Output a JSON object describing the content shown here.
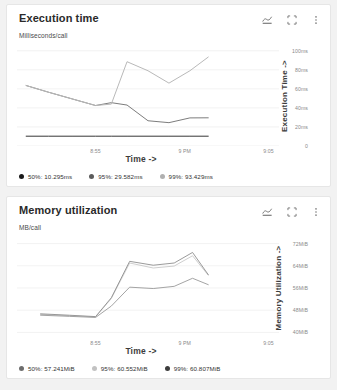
{
  "background": "#f2f2f2",
  "cards": [
    {
      "id": "execution-time",
      "title": "Execution time",
      "subtitle": "Milliseconds/call",
      "actions": [
        {
          "name": "chart-type-icon",
          "label": "chart-icon"
        },
        {
          "name": "fullscreen-icon",
          "label": "expand-icon"
        },
        {
          "name": "overflow-menu-icon",
          "label": "more-vert-icon"
        }
      ],
      "legend": [
        {
          "label": "50%: 10.295ms",
          "color": "#1a1a1a"
        },
        {
          "label": "95%: 29.582ms",
          "color": "#5c5c5c"
        },
        {
          "label": "99%: 93.429ms",
          "color": "#b0b0b0"
        }
      ],
      "chart_data": {
        "type": "line",
        "title": "Execution time",
        "subtitle": "Milliseconds/call",
        "xlabel": "Time ->",
        "ylabel": "Execution Time ->",
        "ylim": [
          0,
          105
        ],
        "yticks": [
          0,
          20,
          40,
          60,
          80,
          100
        ],
        "ytick_labels": [
          "0",
          "20ms",
          "40ms",
          "60ms",
          "80ms",
          "100ms"
        ],
        "xlim": [
          0,
          10
        ],
        "xticks": [
          3,
          6.4,
          9.6
        ],
        "xtick_labels": [
          "8:55",
          "9 PM",
          "9:05"
        ],
        "grid": true,
        "legend_position": "bottom",
        "series": [
          {
            "name": "99%",
            "color": "#b9b9b9",
            "x": [
              0.35,
              1.2,
              2.1,
              3.0,
              3.6,
              4.2,
              5.0,
              5.8,
              6.6,
              7.3
            ],
            "y": [
              63.5,
              56.5,
              49.5,
              42.5,
              44.0,
              88.5,
              79.0,
              66.0,
              79.0,
              93.4
            ]
          },
          {
            "name": "95%",
            "color": "#6d6d6d",
            "x": [
              0.35,
              1.2,
              2.1,
              3.0,
              3.6,
              4.2,
              5.0,
              5.8,
              6.6,
              7.3
            ],
            "y": [
              63.5,
              56.5,
              49.5,
              42.5,
              45.5,
              43.0,
              26.5,
              24.5,
              29.5,
              29.6
            ]
          },
          {
            "name": "50%",
            "color": "#1f1f1f",
            "x": [
              0.35,
              1.2,
              2.1,
              3.0,
              3.6,
              4.2,
              5.0,
              5.8,
              6.6,
              7.3
            ],
            "y": [
              10.3,
              10.3,
              10.3,
              10.3,
              10.3,
              10.3,
              10.3,
              10.3,
              10.3,
              10.3
            ]
          }
        ]
      }
    },
    {
      "id": "memory-utilization",
      "title": "Memory utilization",
      "subtitle": "MB/call",
      "actions": [
        {
          "name": "chart-type-icon",
          "label": "chart-icon"
        },
        {
          "name": "fullscreen-icon",
          "label": "expand-icon"
        },
        {
          "name": "overflow-menu-icon",
          "label": "more-vert-icon"
        }
      ],
      "legend": [
        {
          "label": "50%: 57.241MiB",
          "color": "#6d6d6d"
        },
        {
          "label": "95%: 60.552MiB",
          "color": "#c2c2c2"
        },
        {
          "label": "99%: 60.807MiB",
          "color": "#3d3d3d"
        }
      ],
      "chart_data": {
        "type": "line",
        "title": "Memory utilization",
        "subtitle": "MB/call",
        "xlabel": "Time ->",
        "ylabel": "Memory Utilization ->",
        "ylim": [
          38,
          74
        ],
        "yticks": [
          40,
          48,
          56,
          64,
          72
        ],
        "ytick_labels": [
          "40MiB",
          "48MiB",
          "56MiB",
          "64MiB",
          "72MiB"
        ],
        "xlim": [
          0,
          10
        ],
        "xticks": [
          3,
          6.4,
          9.6
        ],
        "xtick_labels": [
          "8:55",
          "9 PM",
          "9:05"
        ],
        "grid": true,
        "legend_position": "bottom",
        "series": [
          {
            "name": "99%",
            "color": "#8f8f8f",
            "x": [
              0.9,
              2.0,
              3.0,
              3.6,
              4.3,
              5.2,
              6.0,
              6.7,
              7.3
            ],
            "y": [
              46.7,
              46.2,
              45.7,
              52.5,
              65.6,
              64.2,
              65.0,
              68.8,
              60.8
            ]
          },
          {
            "name": "95%",
            "color": "#c8c8c8",
            "x": [
              0.9,
              2.0,
              3.0,
              3.6,
              4.3,
              5.2,
              6.0,
              6.7,
              7.3
            ],
            "y": [
              46.5,
              46.0,
              45.6,
              52.2,
              65.0,
              63.2,
              63.9,
              67.6,
              60.6
            ]
          },
          {
            "name": "50%",
            "color": "#9a9a9a",
            "x": [
              0.9,
              2.0,
              3.0,
              3.6,
              4.3,
              5.2,
              6.0,
              6.7,
              7.3
            ],
            "y": [
              46.2,
              45.8,
              45.4,
              49.5,
              56.3,
              55.8,
              56.6,
              59.5,
              57.2
            ]
          }
        ]
      }
    }
  ]
}
